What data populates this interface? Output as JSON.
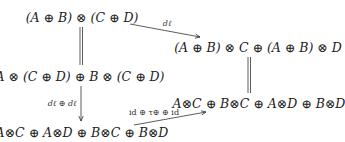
{
  "diagram": {
    "type": "commutative-diagram",
    "nodes": [
      {
        "id": "top_left",
        "label": "(A ⊕ B) ⊗ (C ⊕ D)",
        "x": 82,
        "y": 17
      },
      {
        "id": "top_right",
        "label": "(A ⊕ B) ⊗ C ⊕ (A ⊕ B) ⊗ D",
        "x": 258,
        "y": 47
      },
      {
        "id": "mid_left",
        "label": "A ⊗ (C ⊕ D) ⊕ B ⊗ (C ⊕ D)",
        "x": 80,
        "y": 76
      },
      {
        "id": "bottom_right",
        "label": "A⊗C ⊕ B⊗C ⊕ A⊗D ⊕ B⊗D",
        "x": 259,
        "y": 103
      },
      {
        "id": "bottom_left",
        "label": "A⊗C ⊕ A⊗D ⊕ B⊗C ⊕ B⊗D",
        "x": 82,
        "y": 132
      }
    ],
    "edges": [
      {
        "from": "top_left",
        "to": "top_right",
        "label": "d_ℓ",
        "style": "arrow"
      },
      {
        "from": "top_left",
        "to": "mid_left",
        "label": "",
        "style": "equality"
      },
      {
        "from": "mid_left",
        "to": "bottom_left",
        "label": "d_ℓ ⊕ d_ℓ",
        "style": "arrow"
      },
      {
        "from": "top_right",
        "to": "bottom_right",
        "label": "",
        "style": "equality"
      },
      {
        "from": "bottom_left",
        "to": "bottom_right",
        "label": "id ⊕ τ_⊕ ⊕ id",
        "style": "arrow"
      }
    ],
    "edge_labels": {
      "d_l": "dℓ",
      "d_l_sum_main": "dℓ ⊕ dℓ",
      "id_tau_id": "id ⊕ τ⊕ ⊕ id"
    }
  }
}
